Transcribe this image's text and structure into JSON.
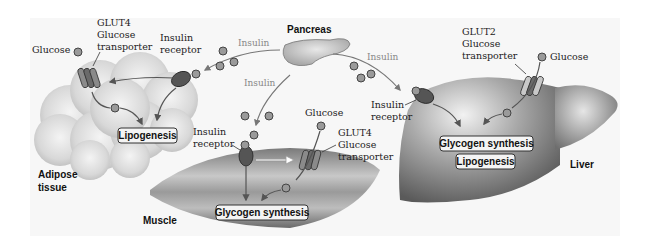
{
  "diagram": {
    "pancreas": {
      "label": "Pancreas"
    },
    "insulin_labels": [
      "Insulin",
      "Insulin",
      "Insulin"
    ],
    "adipose": {
      "label_line1": "Adipose",
      "label_line2": "tissue",
      "glucose_label": "Glucose",
      "transporter_line1": "GLUT4",
      "transporter_line2": "Glucose",
      "transporter_line3": "transporter",
      "receptor_line1": "Insulin",
      "receptor_line2": "receptor",
      "process": "Lipogenesis"
    },
    "muscle": {
      "label": "Muscle",
      "glucose_label": "Glucose",
      "transporter_line1": "GLUT4",
      "transporter_line2": "Glucose",
      "transporter_line3": "transporter",
      "receptor_line1": "Insulin",
      "receptor_line2": "receptor",
      "process": "Glycogen synthesis"
    },
    "liver": {
      "label": "Liver",
      "glucose_label": "Glucose",
      "transporter_line1": "GLUT2",
      "transporter_line2": "Glucose",
      "transporter_line3": "transporter",
      "receptor_line1": "Insulin",
      "receptor_line2": "receptor",
      "process1": "Glycogen synthesis",
      "process2": "Lipogenesis"
    }
  }
}
